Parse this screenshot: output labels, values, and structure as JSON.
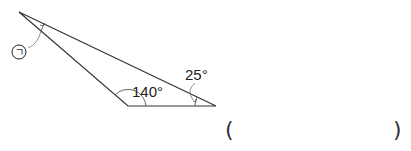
{
  "diagram": {
    "type": "triangle-angle-problem",
    "vertices": {
      "top": [
        19,
        12
      ],
      "bottom_left": [
        128,
        106
      ],
      "bottom_right": [
        216,
        106
      ]
    },
    "angles": {
      "bottom_left": "140°",
      "bottom_right": "25°",
      "top_unknown_label": "ㄱ"
    },
    "stroke_color": "#333333"
  },
  "answer_box": {
    "open": "(",
    "close": ")"
  }
}
